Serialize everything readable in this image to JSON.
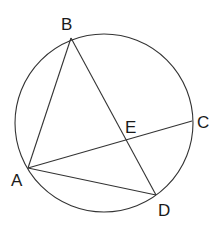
{
  "diagram": {
    "type": "circle-geometry",
    "circle": {
      "cx": 104,
      "cy": 123,
      "r": 89
    },
    "points": {
      "A": {
        "x": 28,
        "y": 168,
        "label": "A",
        "lx": 11,
        "ly": 186
      },
      "B": {
        "x": 71,
        "y": 38,
        "label": "B",
        "lx": 61,
        "ly": 30
      },
      "C": {
        "x": 192,
        "y": 121,
        "label": "C",
        "lx": 197,
        "ly": 128
      },
      "D": {
        "x": 156,
        "y": 195,
        "label": "D",
        "lx": 158,
        "ly": 216
      },
      "E": {
        "x": 126,
        "y": 140,
        "label": "E",
        "lx": 125,
        "ly": 133
      }
    },
    "segments": [
      {
        "from": "A",
        "to": "B"
      },
      {
        "from": "B",
        "to": "D"
      },
      {
        "from": "A",
        "to": "C"
      },
      {
        "from": "A",
        "to": "D"
      }
    ],
    "colors": {
      "stroke": "#333333",
      "label": "#1a1a1a",
      "background": "#ffffff"
    }
  }
}
